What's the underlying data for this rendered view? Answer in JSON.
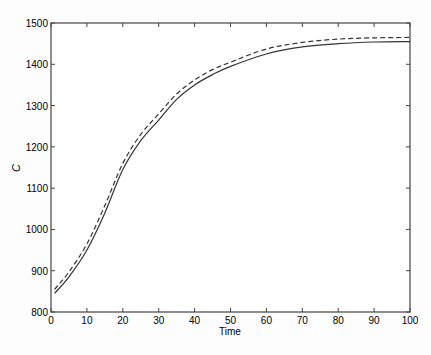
{
  "chart_data": {
    "type": "line",
    "title": "",
    "xlabel": "Time",
    "ylabel": "C",
    "xlim": [
      0,
      100
    ],
    "ylim": [
      800,
      1500
    ],
    "xticks": [
      0,
      10,
      20,
      30,
      40,
      50,
      60,
      70,
      80,
      90,
      100
    ],
    "yticks": [
      800,
      900,
      1000,
      1100,
      1200,
      1300,
      1400,
      1500
    ],
    "grid": false,
    "legend": null,
    "x": [
      1,
      5,
      10,
      15,
      20,
      25,
      30,
      35,
      40,
      45,
      50,
      60,
      70,
      80,
      90,
      100
    ],
    "series": [
      {
        "name": "solid",
        "style": "solid",
        "values": [
          845,
          885,
          950,
          1040,
          1145,
          1215,
          1265,
          1315,
          1350,
          1375,
          1395,
          1425,
          1442,
          1450,
          1454,
          1455
        ]
      },
      {
        "name": "dashed",
        "style": "dashed",
        "values": [
          855,
          897,
          965,
          1058,
          1160,
          1230,
          1280,
          1328,
          1362,
          1387,
          1405,
          1437,
          1453,
          1461,
          1464,
          1465
        ]
      }
    ]
  },
  "caption": "Figure 5.8: C versus time (dashed for ... 10; solid for ... )"
}
